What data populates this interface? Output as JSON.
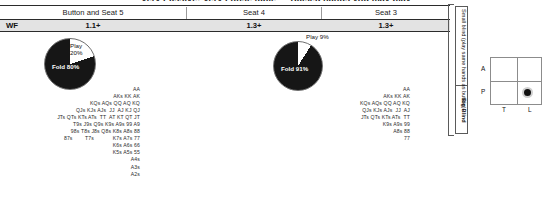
{
  "headline": "Very Passive: Very Loose table — Raised hands you may play",
  "seat_header": {
    "columns": [
      {
        "label": "Button and Seat 5",
        "multiplier": "1.1+"
      },
      {
        "label": "Seat 4",
        "multiplier": "1.3+"
      },
      {
        "label": "Seat 3",
        "multiplier": "1.3+"
      }
    ],
    "row_label": "WF"
  },
  "pies": [
    {
      "id": "pie-button-seat5",
      "play_label": "Play",
      "play_pct_label": "20%",
      "fold_label": "Fold 80%",
      "play_value": 20,
      "fold_value": 80
    },
    {
      "id": "pie-seat3",
      "play_label": "Play 9%",
      "play_pct_label": "",
      "fold_label": "Fold 91%",
      "play_value": 9,
      "fold_value": 91
    }
  ],
  "hand_lists": {
    "button_seat5": [
      "AA",
      "AKs KK AK",
      "KQs AQs QQ AQ KQ",
      "QJs KJs AJs  JJ  AJ KJ QJ",
      "JTs QTs KTs ATs  TT  AT KT QT JT",
      "T9s J9s Q9s K9s A9s 99 A9",
      "98s T8s J8s Q8s K8s A8s 88",
      "87s        T7s            K7s A7s 77",
      "K6s A6s 66",
      "K5s A5s 55",
      "A4s",
      "A3s",
      "A2s"
    ],
    "seat3": [
      "AA",
      "AKs KK AK",
      "KQs AQs QQ AQ KQ",
      "QJs KJs AJs  JJ  AJ",
      "JTs QTs KTs ATs  TT",
      "K9s A9s 99",
      "A8s 88",
      "77"
    ]
  },
  "blinds": {
    "small_blind": "Small blind (play same hands as button)",
    "big_blind": "Big Blind"
  },
  "matrix": {
    "row_labels": [
      "A",
      "P"
    ],
    "col_labels": [
      "T",
      "L"
    ],
    "marker_row": "P",
    "marker_col": "L"
  }
}
